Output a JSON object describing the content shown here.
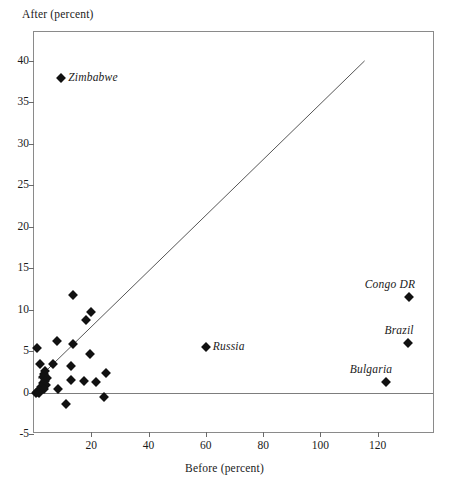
{
  "chart_data": {
    "type": "scatter",
    "title": "",
    "xlabel": "Before (percent)",
    "ylabel": "After (percent)",
    "xlim": [
      0,
      140
    ],
    "ylim": [
      -5,
      43.5
    ],
    "grid": false,
    "legend": null,
    "x_ticks": [
      20,
      40,
      60,
      80,
      100,
      120
    ],
    "y_ticks": [
      -5,
      0,
      5,
      10,
      15,
      20,
      25,
      30,
      35,
      40
    ],
    "x_tick_labels": [
      "20",
      "40",
      "60",
      "80",
      "100",
      "120"
    ],
    "y_tick_labels": [
      "-5",
      "0",
      "5",
      "10",
      "15",
      "20",
      "25",
      "30",
      "35",
      "40"
    ],
    "reference_line": {
      "name": "45-degree line",
      "x_start": 1.5,
      "y_start": 1.5,
      "x_end": 116,
      "y_end": 40
    },
    "zero_line": {
      "name": "zero horizontal line",
      "y": 0
    },
    "points": [
      {
        "label": "Zimbabwe",
        "x": 9.5,
        "y": 38.0,
        "label_pos": "right-of"
      },
      {
        "label": "Congo DR",
        "x": 131.0,
        "y": 11.5,
        "label_pos": "above-right"
      },
      {
        "label": "Brazil",
        "x": 130.5,
        "y": 6.0,
        "label_pos": "above-right"
      },
      {
        "label": "Bulgaria",
        "x": 123.0,
        "y": 1.3,
        "label_pos": "above-right"
      },
      {
        "label": "Russia",
        "x": 60.0,
        "y": 5.5,
        "label_pos": "right-of"
      },
      {
        "label": "",
        "x": 13.5,
        "y": 11.8
      },
      {
        "label": "",
        "x": 20.0,
        "y": 9.7
      },
      {
        "label": "",
        "x": 18.0,
        "y": 8.8
      },
      {
        "label": "",
        "x": 8.0,
        "y": 6.2
      },
      {
        "label": "",
        "x": 13.5,
        "y": 5.8
      },
      {
        "label": "",
        "x": 1.0,
        "y": 5.4
      },
      {
        "label": "",
        "x": 19.5,
        "y": 4.6
      },
      {
        "label": "",
        "x": 6.5,
        "y": 3.5
      },
      {
        "label": "",
        "x": 2.0,
        "y": 3.4
      },
      {
        "label": "",
        "x": 13.0,
        "y": 3.2
      },
      {
        "label": "",
        "x": 25.0,
        "y": 2.3
      },
      {
        "label": "",
        "x": 4.0,
        "y": 2.6
      },
      {
        "label": "",
        "x": 3.5,
        "y": 2.2
      },
      {
        "label": "",
        "x": 3.0,
        "y": 1.9
      },
      {
        "label": "",
        "x": 4.5,
        "y": 1.7
      },
      {
        "label": "",
        "x": 3.8,
        "y": 1.4
      },
      {
        "label": "",
        "x": 3.2,
        "y": 1.1
      },
      {
        "label": "",
        "x": 4.2,
        "y": 0.9
      },
      {
        "label": "",
        "x": 2.6,
        "y": 0.7
      },
      {
        "label": "",
        "x": 3.6,
        "y": 0.4
      },
      {
        "label": "",
        "x": 2.2,
        "y": 0.2
      },
      {
        "label": "",
        "x": 1.2,
        "y": 0.1
      },
      {
        "label": "",
        "x": 0.8,
        "y": 0.0
      },
      {
        "label": "",
        "x": 1.8,
        "y": -0.1
      },
      {
        "label": "",
        "x": 8.5,
        "y": 0.4
      },
      {
        "label": "",
        "x": 13.0,
        "y": 1.5
      },
      {
        "label": "",
        "x": 17.5,
        "y": 1.4
      },
      {
        "label": "",
        "x": 21.5,
        "y": 1.3
      },
      {
        "label": "",
        "x": 24.5,
        "y": -0.5
      },
      {
        "label": "",
        "x": 11.0,
        "y": -1.4
      }
    ]
  }
}
